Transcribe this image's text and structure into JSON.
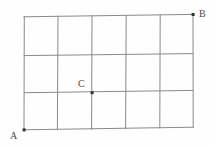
{
  "figure": {
    "kind": "geometry-grid-diagram",
    "background_color": "#fefefe",
    "grid": {
      "columns": 5,
      "rows": 3,
      "line_color": "#8a8a8a",
      "outline_color": "#7a7a7a",
      "line_width": 1,
      "x_positions": [
        24,
        58,
        92,
        126,
        160,
        193
      ],
      "y_positions": [
        16,
        55,
        92,
        129
      ]
    },
    "points": [
      {
        "id": "A",
        "label": "A",
        "role": "bottom-left-corner",
        "x": 24,
        "y": 130,
        "label_x": 10,
        "label_y": 131,
        "dot_color": "#333333",
        "dot_size": 3
      },
      {
        "id": "B",
        "label": "B",
        "role": "top-right-corner",
        "x": 193,
        "y": 15,
        "label_x": 199,
        "label_y": 9,
        "dot_color": "#333333",
        "dot_size": 3
      },
      {
        "id": "C",
        "label": "C",
        "role": "interior-lattice-point",
        "x": 92,
        "y": 92,
        "label_x": 78,
        "label_y": 79,
        "dot_color": "#333333",
        "dot_size": 3
      }
    ]
  }
}
